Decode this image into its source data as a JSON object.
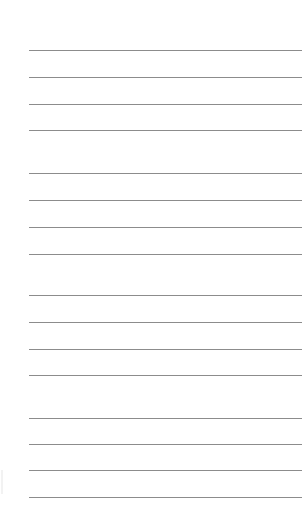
{
  "page": {
    "background": "#ffffff",
    "line_color": "#8c8c8c",
    "groups": [
      {
        "lines": [
          50,
          77,
          104,
          130
        ]
      },
      {
        "lines": [
          173,
          200,
          227,
          254
        ]
      },
      {
        "lines": [
          295,
          322,
          349,
          375
        ]
      },
      {
        "lines": [
          418,
          444,
          470,
          497
        ]
      }
    ]
  }
}
